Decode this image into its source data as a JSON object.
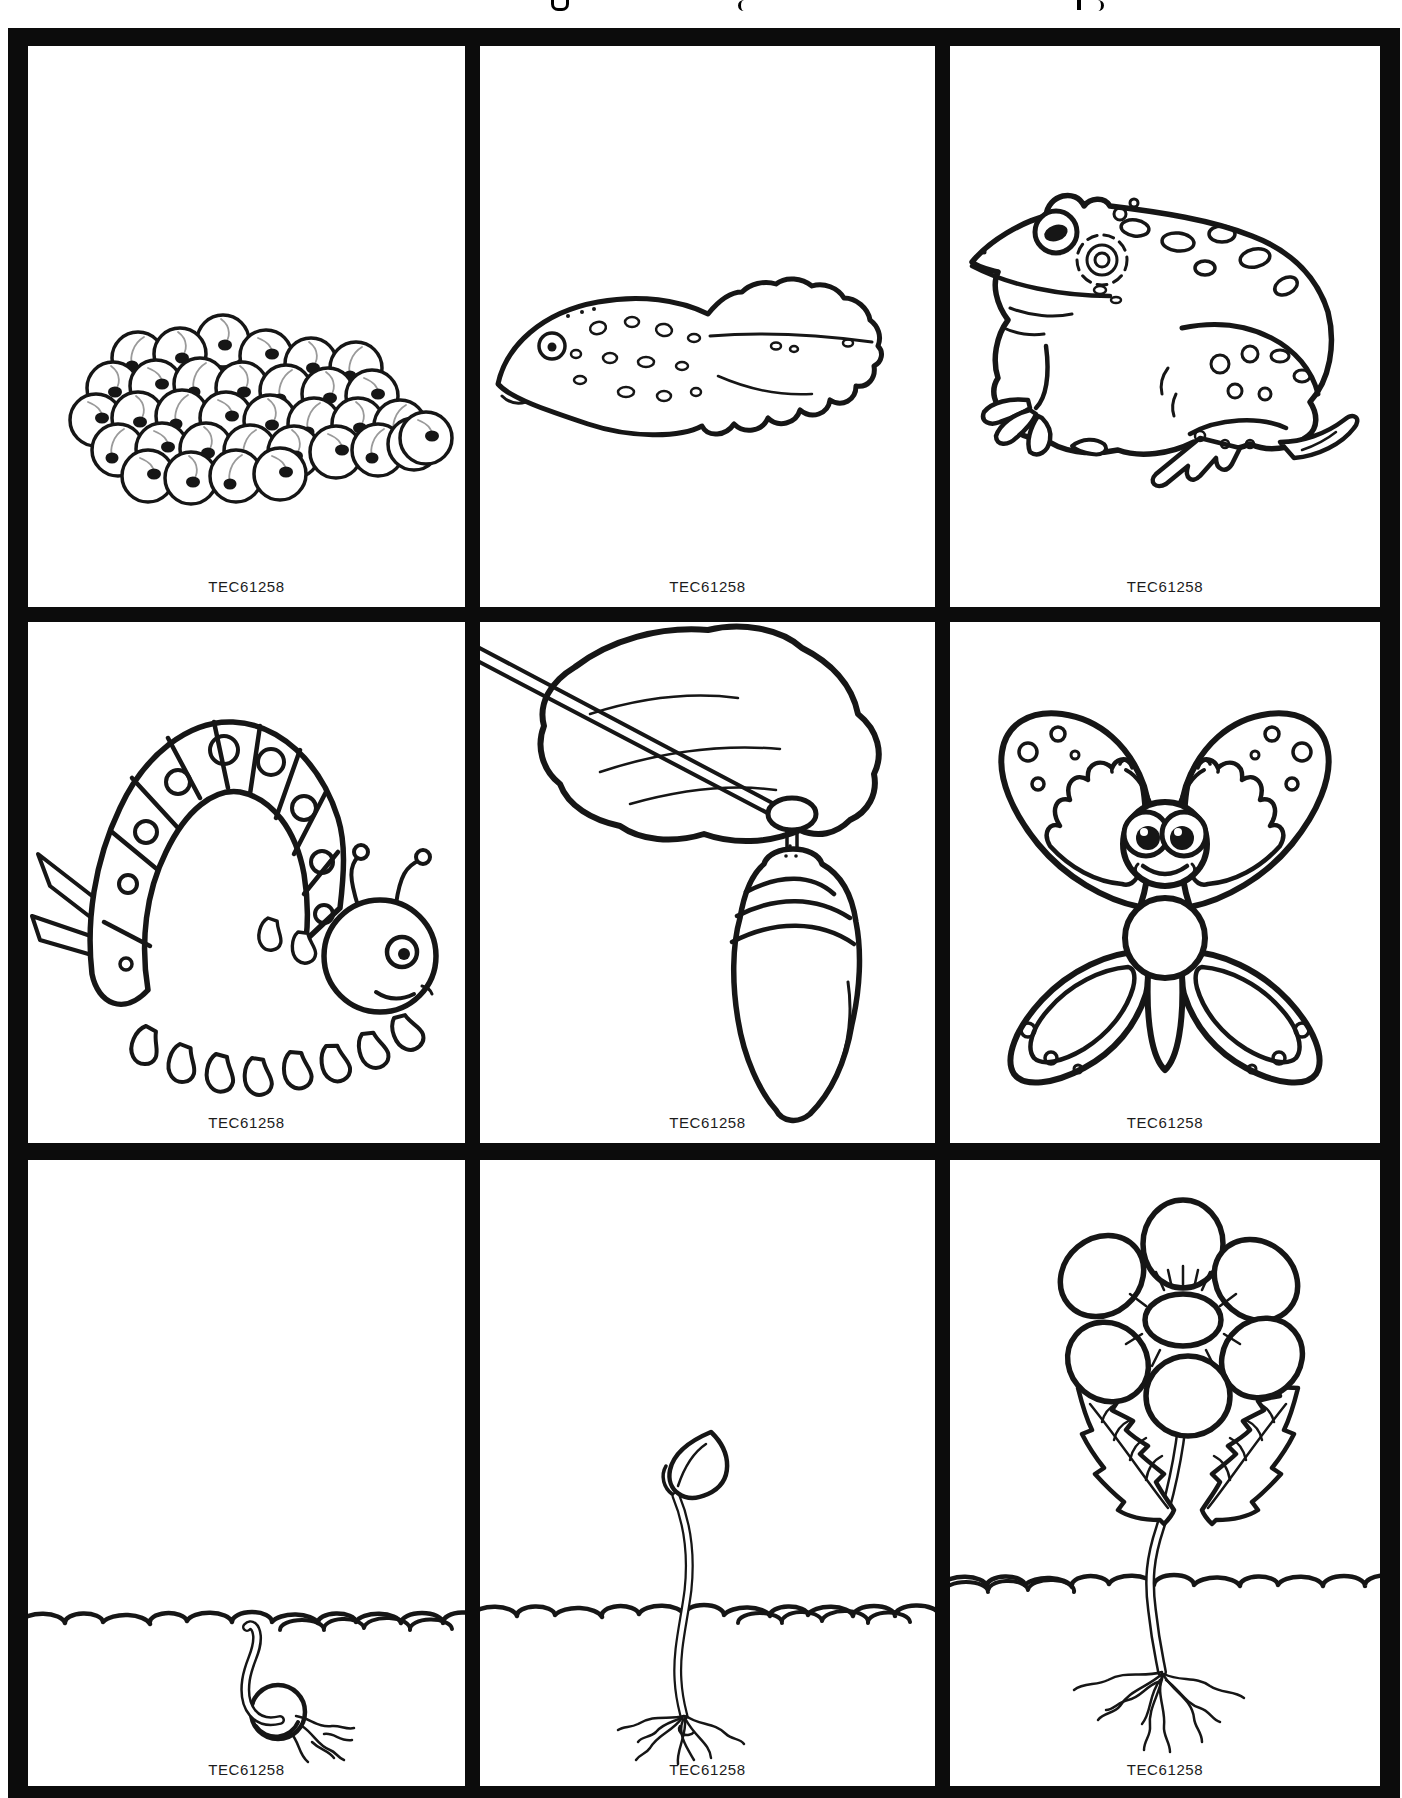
{
  "document": {
    "kind": "scanned worksheet — life cycle sequencing picture cards",
    "product_code": "TEC61258",
    "grid": {
      "rows": 3,
      "columns": 3
    },
    "colors": {
      "ink": "#161616",
      "border": "#0c0c0c",
      "paper": "#ffffff"
    }
  },
  "cards": [
    {
      "subject": "frog-eggs",
      "caption": "TEC61258"
    },
    {
      "subject": "tadpole",
      "caption": "TEC61258"
    },
    {
      "subject": "frog",
      "caption": "TEC61258"
    },
    {
      "subject": "caterpillar",
      "caption": "TEC61258"
    },
    {
      "subject": "chrysalis-on-leaf",
      "caption": "TEC61258"
    },
    {
      "subject": "butterfly",
      "caption": "TEC61258"
    },
    {
      "subject": "sprouting-seed",
      "caption": "TEC61258"
    },
    {
      "subject": "seedling",
      "caption": "TEC61258"
    },
    {
      "subject": "flowering-plant",
      "caption": "TEC61258"
    }
  ]
}
